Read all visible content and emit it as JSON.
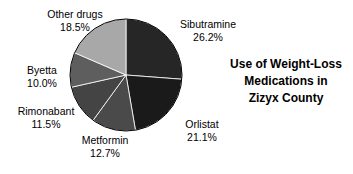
{
  "chart_data": {
    "type": "pie",
    "title": "Use of Weight-Loss Medications in Zizyx County",
    "title_lines": [
      "Use of Weight-Loss",
      "Medications in",
      "Zizyx County"
    ],
    "xlabel": "",
    "ylabel": "",
    "legend_position": "none",
    "grid": false,
    "start_angle_deg": 90,
    "direction": "clockwise",
    "units": "percent",
    "categories": [
      "Sibutramine",
      "Orlistat",
      "Metformin",
      "Rimonabant",
      "Byetta",
      "Other drugs"
    ],
    "values": [
      26.2,
      21.1,
      12.7,
      11.5,
      10.0,
      18.5
    ],
    "labels": [
      "26.2%",
      "21.1%",
      "12.7%",
      "11.5%",
      "10.0%",
      "18.5%"
    ],
    "colors": [
      "#262626",
      "#1a1a1a",
      "#4a4a4a",
      "#444444",
      "#5e5e5e",
      "#a8a8a8"
    ],
    "slices": [
      {
        "name": "Sibutramine",
        "value": 26.2,
        "label": "26.2%",
        "color": "#262626"
      },
      {
        "name": "Orlistat",
        "value": 21.1,
        "label": "21.1%",
        "color": "#1a1a1a"
      },
      {
        "name": "Metformin",
        "value": 12.7,
        "label": "12.7%",
        "color": "#4a4a4a"
      },
      {
        "name": "Rimonabant",
        "value": 11.5,
        "label": "11.5%",
        "color": "#444444"
      },
      {
        "name": "Byetta",
        "value": 10.0,
        "label": "10.0%",
        "color": "#5e5e5e"
      },
      {
        "name": "Other drugs",
        "value": 18.5,
        "label": "18.5%",
        "color": "#a8a8a8"
      }
    ]
  },
  "figure": {
    "background": "#ffffff",
    "outline_color": "#000000",
    "center_x": 126,
    "center_y": 75,
    "radius": 56
  }
}
